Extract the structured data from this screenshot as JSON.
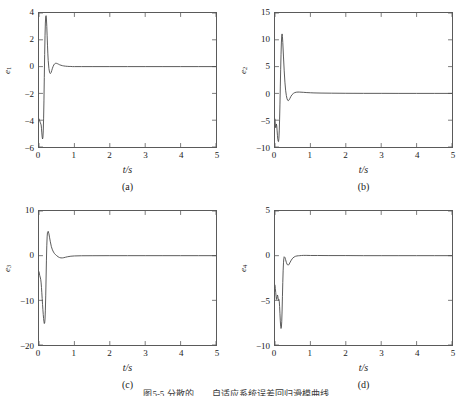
{
  "figure": {
    "caption": "图5-5  分散的……自适应系统误差回归滑模曲线",
    "line_color": "#4a4a4a",
    "axis_color": "#5a5a5a"
  },
  "panels": [
    {
      "id": "a",
      "subcaption": "(a)",
      "ylabel_base": "e",
      "ylabel_sub": "1",
      "xlabel": "t/s",
      "chart_data": {
        "type": "line",
        "title": "",
        "xlabel": "t/s",
        "ylabel": "e1",
        "xlim": [
          0,
          5
        ],
        "ylim": [
          -6,
          4
        ],
        "xticks": [
          0,
          1,
          2,
          3,
          4,
          5
        ],
        "yticks": [
          -6,
          -4,
          -2,
          0,
          2,
          4
        ],
        "xtick_labels": [
          "0",
          "1",
          "2",
          "3",
          "4",
          "5"
        ],
        "ytick_labels": [
          "-6",
          "-4",
          "-2",
          "0",
          "2",
          "4"
        ],
        "grid": false,
        "legend": false,
        "series": [
          {
            "name": "e1",
            "x": [
              0.0,
              0.02,
              0.04,
              0.06,
              0.07,
              0.08,
              0.09,
              0.1,
              0.11,
              0.12,
              0.13,
              0.14,
              0.15,
              0.16,
              0.17,
              0.18,
              0.19,
              0.2,
              0.21,
              0.22,
              0.23,
              0.24,
              0.25,
              0.26,
              0.28,
              0.3,
              0.32,
              0.34,
              0.36,
              0.38,
              0.4,
              0.42,
              0.44,
              0.46,
              0.48,
              0.5,
              0.52,
              0.55,
              0.58,
              0.62,
              0.66,
              0.7,
              0.75,
              0.8,
              0.85,
              0.9,
              0.95,
              1.0,
              1.2,
              1.5,
              2.0,
              2.5,
              3.0,
              3.5,
              4.0,
              4.5,
              5.0
            ],
            "y": [
              -3.9,
              -4.05,
              -4.2,
              -4.35,
              -4.6,
              -4.95,
              -5.25,
              -5.4,
              -5.3,
              -4.8,
              -3.9,
              -2.5,
              -0.8,
              0.9,
              2.3,
              3.25,
              3.72,
              3.8,
              3.55,
              3.0,
              2.3,
              1.6,
              0.95,
              0.45,
              -0.15,
              -0.45,
              -0.52,
              -0.45,
              -0.3,
              -0.12,
              0.02,
              0.13,
              0.2,
              0.24,
              0.25,
              0.24,
              0.22,
              0.18,
              0.14,
              0.1,
              0.07,
              0.05,
              0.03,
              0.02,
              0.01,
              0.01,
              0.0,
              0.0,
              0.0,
              0.0,
              0.0,
              0.0,
              0.0,
              0.0,
              0.0,
              0.0,
              0.0
            ]
          }
        ]
      }
    },
    {
      "id": "b",
      "subcaption": "(b)",
      "ylabel_base": "e",
      "ylabel_sub": "2",
      "xlabel": "t/s",
      "chart_data": {
        "type": "line",
        "title": "",
        "xlabel": "t/s",
        "ylabel": "e2",
        "xlim": [
          0,
          5
        ],
        "ylim": [
          -10,
          15
        ],
        "xticks": [
          0,
          1,
          2,
          3,
          4,
          5
        ],
        "yticks": [
          -10,
          -5,
          0,
          5,
          10,
          15
        ],
        "xtick_labels": [
          "0",
          "1",
          "2",
          "3",
          "4",
          "5"
        ],
        "ytick_labels": [
          "-10",
          "-5",
          "0",
          "5",
          "10",
          "15"
        ],
        "grid": false,
        "legend": false,
        "series": [
          {
            "name": "e2",
            "x": [
              0.0,
              0.01,
              0.02,
              0.03,
              0.04,
              0.05,
              0.06,
              0.07,
              0.08,
              0.09,
              0.1,
              0.11,
              0.12,
              0.13,
              0.14,
              0.15,
              0.16,
              0.17,
              0.18,
              0.19,
              0.2,
              0.21,
              0.22,
              0.24,
              0.26,
              0.28,
              0.3,
              0.32,
              0.34,
              0.36,
              0.38,
              0.4,
              0.42,
              0.45,
              0.48,
              0.52,
              0.56,
              0.6,
              0.65,
              0.7,
              0.8,
              0.9,
              1.0,
              1.1,
              1.3,
              1.6,
              2.0,
              2.5,
              3.0,
              3.5,
              4.0,
              4.5,
              5.0
            ],
            "y": [
              -4.8,
              -5.9,
              -6.4,
              -6.1,
              -5.7,
              -6.1,
              -7.0,
              -7.9,
              -8.55,
              -8.95,
              -9.0,
              -8.4,
              -7.0,
              -4.8,
              -2.0,
              1.2,
              4.4,
              7.2,
              9.4,
              10.7,
              11.1,
              10.6,
              9.5,
              6.8,
              4.2,
              2.1,
              0.6,
              -0.4,
              -1.0,
              -1.3,
              -1.35,
              -1.2,
              -0.95,
              -0.55,
              -0.25,
              0.0,
              0.15,
              0.22,
              0.25,
              0.24,
              0.2,
              0.15,
              0.12,
              0.09,
              0.06,
              0.04,
              0.02,
              0.01,
              0.01,
              0.0,
              0.0,
              0.0,
              0.0
            ]
          }
        ]
      }
    },
    {
      "id": "c",
      "subcaption": "(c)",
      "ylabel_base": "e",
      "ylabel_sub": "3",
      "xlabel": "t/s",
      "chart_data": {
        "type": "line",
        "title": "",
        "xlabel": "t/s",
        "ylabel": "e3",
        "xlim": [
          0,
          5
        ],
        "ylim": [
          -20,
          10
        ],
        "xticks": [
          0,
          1,
          2,
          3,
          4,
          5
        ],
        "yticks": [
          -20,
          -10,
          0,
          10
        ],
        "xtick_labels": [
          "0",
          "1",
          "2",
          "3",
          "4",
          "5"
        ],
        "ytick_labels": [
          "-20",
          "-10",
          "0",
          "10"
        ],
        "grid": false,
        "legend": false,
        "series": [
          {
            "name": "e3",
            "x": [
              0.0,
              0.02,
              0.04,
              0.05,
              0.06,
              0.07,
              0.08,
              0.09,
              0.1,
              0.11,
              0.12,
              0.13,
              0.14,
              0.15,
              0.16,
              0.17,
              0.18,
              0.19,
              0.2,
              0.21,
              0.22,
              0.23,
              0.24,
              0.26,
              0.28,
              0.3,
              0.32,
              0.35,
              0.38,
              0.41,
              0.44,
              0.47,
              0.5,
              0.54,
              0.58,
              0.62,
              0.66,
              0.7,
              0.75,
              0.8,
              0.9,
              1.0,
              1.2,
              1.5,
              2.0,
              2.5,
              3.0,
              3.5,
              4.0,
              4.5,
              5.0
            ],
            "y": [
              -3.6,
              -4.4,
              -5.0,
              -5.4,
              -6.1,
              -7.1,
              -8.3,
              -9.6,
              -10.9,
              -12.1,
              -13.2,
              -14.1,
              -14.8,
              -15.2,
              -15.1,
              -14.2,
              -12.2,
              -9.0,
              -5.0,
              -1.0,
              2.2,
              4.2,
              5.2,
              5.45,
              4.9,
              4.0,
              3.1,
              2.0,
              1.3,
              0.8,
              0.45,
              0.2,
              0.0,
              -0.25,
              -0.42,
              -0.5,
              -0.5,
              -0.45,
              -0.35,
              -0.25,
              -0.12,
              -0.06,
              -0.02,
              -0.01,
              0.0,
              0.0,
              0.0,
              0.0,
              0.0,
              0.0,
              0.0
            ]
          }
        ]
      }
    },
    {
      "id": "d",
      "subcaption": "(d)",
      "ylabel_base": "e",
      "ylabel_sub": "4",
      "xlabel": "t/s",
      "chart_data": {
        "type": "line",
        "title": "",
        "xlabel": "t/s",
        "ylabel": "e4",
        "xlim": [
          0,
          5
        ],
        "ylim": [
          -10,
          5
        ],
        "xticks": [
          0,
          1,
          2,
          3,
          4,
          5
        ],
        "yticks": [
          -10,
          -5,
          0,
          5
        ],
        "xtick_labels": [
          "0",
          "1",
          "2",
          "3",
          "4",
          "5"
        ],
        "ytick_labels": [
          "-10",
          "-5",
          "0",
          "5"
        ],
        "grid": false,
        "legend": false,
        "series": [
          {
            "name": "e4",
            "x": [
              0.0,
              0.01,
              0.02,
              0.03,
              0.04,
              0.05,
              0.06,
              0.07,
              0.08,
              0.09,
              0.1,
              0.11,
              0.12,
              0.13,
              0.14,
              0.15,
              0.16,
              0.17,
              0.18,
              0.19,
              0.2,
              0.21,
              0.22,
              0.23,
              0.24,
              0.25,
              0.26,
              0.28,
              0.3,
              0.32,
              0.34,
              0.36,
              0.38,
              0.4,
              0.43,
              0.46,
              0.5,
              0.54,
              0.58,
              0.62,
              0.66,
              0.7,
              0.75,
              0.8,
              0.85,
              0.9,
              1.0,
              1.2,
              1.5,
              2.0,
              2.5,
              3.0,
              3.5,
              4.0,
              4.5,
              5.0
            ],
            "y": [
              -3.3,
              -3.7,
              -4.1,
              -4.55,
              -4.9,
              -4.8,
              -4.55,
              -4.4,
              -4.55,
              -4.85,
              -5.0,
              -4.9,
              -5.1,
              -5.7,
              -6.5,
              -7.3,
              -7.9,
              -8.15,
              -8.05,
              -7.4,
              -6.2,
              -4.6,
              -3.0,
              -1.7,
              -0.8,
              -0.3,
              -0.12,
              -0.2,
              -0.45,
              -0.75,
              -0.95,
              -1.05,
              -1.05,
              -0.95,
              -0.72,
              -0.5,
              -0.28,
              -0.15,
              -0.07,
              -0.03,
              -0.01,
              0.0,
              0.02,
              0.03,
              0.03,
              0.03,
              0.02,
              0.02,
              0.01,
              0.01,
              0.0,
              0.0,
              0.0,
              0.0,
              0.0,
              0.0
            ]
          }
        ]
      }
    }
  ]
}
